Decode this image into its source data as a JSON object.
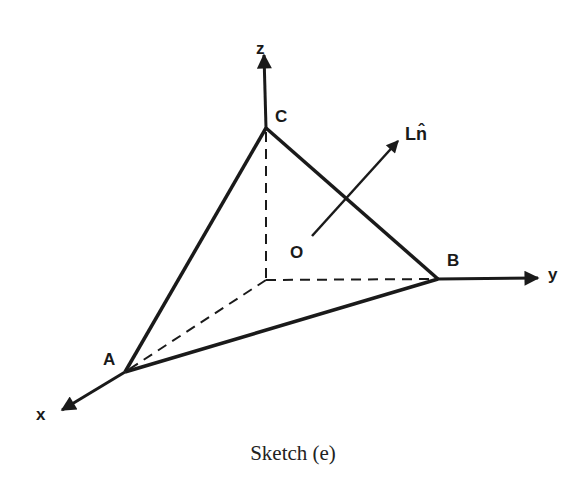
{
  "labels": {
    "z": "z",
    "y": "y",
    "x": "x",
    "A": "A",
    "B": "B",
    "C": "C",
    "O": "O",
    "normal": "Ln̂"
  },
  "caption": "Sketch (e)",
  "colors": {
    "stroke": "#1a1a1a",
    "background": "#ffffff"
  }
}
